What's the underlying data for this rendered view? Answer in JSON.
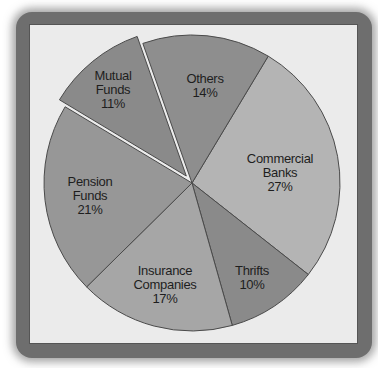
{
  "chart_data": {
    "type": "pie",
    "title": "",
    "start_angle_deg": 31,
    "direction": "clockwise",
    "slices": [
      {
        "name": "Commercial Banks",
        "label_lines": [
          "Commercial",
          "Banks"
        ],
        "value": 27,
        "pct_label": "27%",
        "color": "#b4b4b4",
        "exploded": false,
        "label_pos": [
          280,
          173
        ]
      },
      {
        "name": "Thrifts",
        "label_lines": [
          "Thrifts"
        ],
        "value": 10,
        "pct_label": "10%",
        "color": "#8a8a8a",
        "exploded": false,
        "label_pos": [
          252,
          278
        ]
      },
      {
        "name": "Insurance Companies",
        "label_lines": [
          "Insurance",
          "Companies"
        ],
        "value": 17,
        "pct_label": "17%",
        "color": "#a6a6a6",
        "exploded": false,
        "label_pos": [
          165,
          285
        ]
      },
      {
        "name": "Pension Funds",
        "label_lines": [
          "Pension",
          "Funds"
        ],
        "value": 21,
        "pct_label": "21%",
        "color": "#979797",
        "exploded": false,
        "label_pos": [
          90,
          196
        ]
      },
      {
        "name": "Mutual Funds",
        "label_lines": [
          "Mutual",
          "Funds"
        ],
        "value": 11,
        "pct_label": "11%",
        "color": "#8a8a8a",
        "exploded": true,
        "label_pos": [
          113,
          90
        ]
      },
      {
        "name": "Others",
        "label_lines": [
          "Others"
        ],
        "value": 14,
        "pct_label": "14%",
        "color": "#8e8e8e",
        "exploded": false,
        "label_pos": [
          205,
          86
        ]
      }
    ],
    "center": [
      192,
      183
    ],
    "radius": 148,
    "explode_offset": 9,
    "stroke_color": "#4a4a4a",
    "background": "#ebebeb"
  }
}
